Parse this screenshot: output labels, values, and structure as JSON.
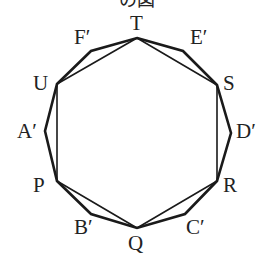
{
  "title": "の図",
  "colors": {
    "stroke": "#1a1a1a",
    "text": "#222222"
  },
  "outer_polygon": {
    "points": [
      [
        137,
        38
      ],
      [
        183,
        51
      ],
      [
        217,
        85
      ],
      [
        231,
        133
      ],
      [
        217,
        181
      ],
      [
        185,
        214
      ],
      [
        137,
        228
      ],
      [
        91,
        214
      ],
      [
        57,
        181
      ],
      [
        45,
        131
      ],
      [
        57,
        84
      ],
      [
        91,
        51
      ]
    ]
  },
  "inner_polygon": {
    "points": [
      [
        137,
        38
      ],
      [
        217,
        85
      ],
      [
        217,
        181
      ],
      [
        137,
        228
      ],
      [
        57,
        181
      ],
      [
        57,
        84
      ]
    ]
  },
  "labels": [
    {
      "text": "T",
      "x": 130,
      "y": 30
    },
    {
      "text": "E′",
      "x": 190,
      "y": 44
    },
    {
      "text": "S",
      "x": 223,
      "y": 90
    },
    {
      "text": "D′",
      "x": 236,
      "y": 138
    },
    {
      "text": "R",
      "x": 223,
      "y": 192
    },
    {
      "text": "C′",
      "x": 186,
      "y": 234
    },
    {
      "text": "Q",
      "x": 128,
      "y": 250
    },
    {
      "text": "B′",
      "x": 74,
      "y": 234
    },
    {
      "text": "P",
      "x": 33,
      "y": 192
    },
    {
      "text": "A′",
      "x": 17,
      "y": 138
    },
    {
      "text": "U",
      "x": 33,
      "y": 90
    },
    {
      "text": "F′",
      "x": 74,
      "y": 44
    }
  ]
}
